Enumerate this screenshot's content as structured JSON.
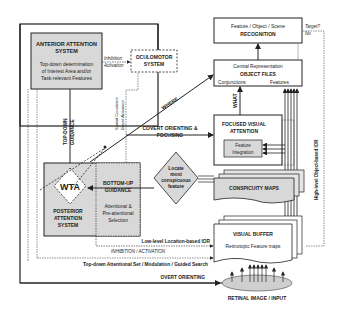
{
  "anterior": {
    "title1": "ANTERIOR ATTENTION",
    "title2": "SYSTEM",
    "desc1": "Top-down determination",
    "desc2": "of Interest Area and/or",
    "desc3": "Task-relevant Features"
  },
  "oculomotor": {
    "title1": "OCULOMOTOR",
    "title2": "SYSTEM"
  },
  "inhib_act": {
    "l1": "Inhibition",
    "l2": "Activation"
  },
  "recognition": {
    "l1": "Feature / Object / Scene",
    "l2": "RECOGNITION"
  },
  "target": {
    "l1": "Target?",
    "l2": "No"
  },
  "object_files": {
    "l1": "Central Representation",
    "l2": "OBJECT FILES",
    "l3": "Conjunctions",
    "l4": "Features"
  },
  "where": "WHERE",
  "what": "WHAT",
  "spatial": {
    "l1": "Spatial Coordinate",
    "l2": "Based Activation"
  },
  "top_down": {
    "l1": "TOP-DOWN",
    "l2": "GUIDANCE"
  },
  "covert": {
    "l1": "COVERT ORIENTING &",
    "l2": "FOCUSING"
  },
  "focused": {
    "l1": "FOCUSED VISUAL",
    "l2": "ATTENTION",
    "fi1": "Feature",
    "fi2": "Integration"
  },
  "high_level": "High-level Object-based IOR",
  "wta": "WTA",
  "posterior": {
    "l1": "POSTERIOR",
    "l2": "ATTENTION",
    "l3": "SYSTEM"
  },
  "bottom_up": {
    "l1": "BOTTOM-UP",
    "l2": "GUIDANCE",
    "l3": "Attentional &",
    "l4": "Pre-attentional",
    "l5": "Selection"
  },
  "locate": {
    "l1": "Locate",
    "l2": "most",
    "l3": "conspicuous",
    "l4": "feature"
  },
  "conspicuity": "CONSPICUITY MAPS",
  "visual_buffer": {
    "l1": "VISUAL BUFFER",
    "l2": "Retinotopic Feature maps"
  },
  "low_level": "Low-level Location-based IOR",
  "inhibition_activation": "INHIBITION / ACTIVATION",
  "top_down_set": "Top-down Attentional Set / Modulation / Guided Search",
  "overt": "OVERT ORIENTING",
  "retinal": "RETINAL IMAGE / INPUT"
}
